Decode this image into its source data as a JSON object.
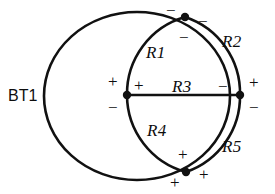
{
  "diagram": {
    "stroke_color": "#111111",
    "background_color": "#ffffff",
    "node_color": "#111111",
    "source": {
      "designator": "BT1",
      "x": 8,
      "y": 88
    },
    "components": [
      {
        "id": "R1",
        "designator": "R1",
        "x": 146,
        "y": 44
      },
      {
        "id": "R2",
        "designator": "R2",
        "x": 222,
        "y": 33
      },
      {
        "id": "R3",
        "designator": "R3",
        "x": 172,
        "y": 78
      },
      {
        "id": "R4",
        "designator": "R4",
        "x": 147,
        "y": 122
      },
      {
        "id": "R5",
        "designator": "R5",
        "x": 222,
        "y": 138
      }
    ],
    "nodes": [
      {
        "id": "node-top",
        "cx": 185,
        "cy": 17
      },
      {
        "id": "node-left",
        "cx": 127,
        "cy": 95
      },
      {
        "id": "node-right",
        "cx": 240,
        "cy": 95
      },
      {
        "id": "node-bottom",
        "cx": 186,
        "cy": 172
      }
    ],
    "polarity_marks": [
      {
        "id": "mark-top-left",
        "symbol": "−",
        "x": 166,
        "y": 2
      },
      {
        "id": "mark-top-right",
        "symbol": "−",
        "x": 198,
        "y": 13
      },
      {
        "id": "mark-top-below",
        "symbol": "−",
        "x": 179,
        "y": 29
      },
      {
        "id": "mark-left-upper-left",
        "symbol": "+",
        "x": 108,
        "y": 73
      },
      {
        "id": "mark-left-upper-right",
        "symbol": "+",
        "x": 134,
        "y": 77
      },
      {
        "id": "mark-left-lower-left",
        "symbol": "−",
        "x": 108,
        "y": 99
      },
      {
        "id": "mark-right-left",
        "symbol": "−",
        "x": 218,
        "y": 78
      },
      {
        "id": "mark-right-upper-right",
        "symbol": "+",
        "x": 249,
        "y": 74
      },
      {
        "id": "mark-right-lower-right",
        "symbol": "−",
        "x": 249,
        "y": 99
      },
      {
        "id": "mark-bottom-above",
        "symbol": "+",
        "x": 178,
        "y": 146
      },
      {
        "id": "mark-bottom-right",
        "symbol": "+",
        "x": 199,
        "y": 166
      },
      {
        "id": "mark-bottom-below",
        "symbol": "+",
        "x": 170,
        "y": 174
      }
    ]
  }
}
